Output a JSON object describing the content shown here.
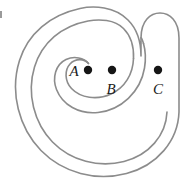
{
  "figure": {
    "kind": "geometric-diagram",
    "width": 193,
    "height": 179,
    "background_color": "#ffffff",
    "curve": {
      "name": "spiral-ribbon",
      "stroke_color": "#8c8c8c",
      "stroke_width": 1.6,
      "fill": "none",
      "description": "single closed outline forming a two-turn spiral band with rounded ends"
    },
    "points": [
      {
        "id": "A",
        "label": "A",
        "dot_color": "#161616",
        "dot_radius": 4.2,
        "dot_x": 88,
        "dot_y": 70,
        "label_x": 74,
        "label_y": 76
      },
      {
        "id": "B",
        "label": "B",
        "dot_color": "#161616",
        "dot_radius": 4.2,
        "dot_x": 112,
        "dot_y": 70,
        "label_x": 111,
        "label_y": 94
      },
      {
        "id": "C",
        "label": "C",
        "dot_color": "#161616",
        "dot_radius": 4.2,
        "dot_x": 158,
        "dot_y": 70,
        "label_x": 158,
        "label_y": 94
      }
    ],
    "corner_mark": {
      "name": "edge-tick",
      "x": 0,
      "y": 11,
      "width": 2,
      "height": 7,
      "color": "#9a9a9a"
    }
  }
}
